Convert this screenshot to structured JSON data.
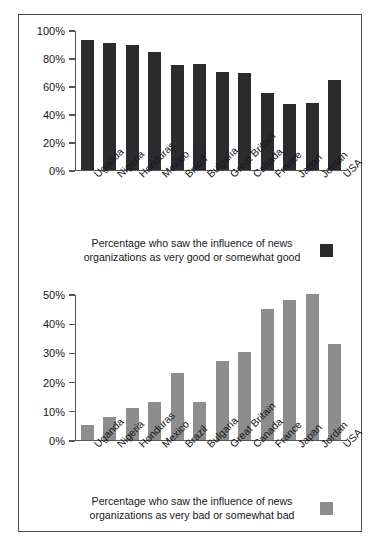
{
  "chart_data": [
    {
      "type": "bar",
      "id": "good",
      "title": "",
      "xlabel": "",
      "ylabel": "",
      "ylim": [
        0,
        100
      ],
      "yticks": [
        0,
        20,
        40,
        60,
        80,
        100
      ],
      "ytick_labels": [
        "0%",
        "20%",
        "40%",
        "60%",
        "80%",
        "100%"
      ],
      "grid": false,
      "bar_color": "#2b2b2e",
      "legend_position": "bottom",
      "legend": "Percentage who saw the influence of news organizations as very good or somewhat good",
      "legend_line1": "Percentage who saw the influence of news",
      "legend_line2": "organizations as very good or somewhat good",
      "categories": [
        "Uganda",
        "Nigeria",
        "Honduras",
        "Mexico",
        "Brazil",
        "Bulgaria",
        "Great Britain",
        "Canada",
        "France",
        "Japan",
        "Jordan",
        "USA"
      ],
      "values": [
        93,
        91,
        89,
        84,
        75,
        76,
        70,
        69,
        55,
        47,
        48,
        64
      ]
    },
    {
      "type": "bar",
      "id": "bad",
      "title": "",
      "xlabel": "",
      "ylabel": "",
      "ylim": [
        0,
        50
      ],
      "yticks": [
        0,
        10,
        20,
        30,
        40,
        50
      ],
      "ytick_labels": [
        "0%",
        "10%",
        "20%",
        "30%",
        "40%",
        "50%"
      ],
      "grid": false,
      "bar_color": "#8d8d8d",
      "legend_position": "bottom",
      "legend": "Percentage who saw the influence of news organizations as very bad or somewhat bad",
      "legend_line1": "Percentage who saw the influence of news",
      "legend_line2": "organizations as very bad or somewhat bad",
      "categories": [
        "Uganda",
        "Nigeria",
        "Honduras",
        "Mexico",
        "Brazil",
        "Bulgaria",
        "Great Britain",
        "Canada",
        "France",
        "Japan",
        "Jordan",
        "USA"
      ],
      "values": [
        5,
        8,
        11,
        13,
        23,
        13,
        27,
        30,
        45,
        48,
        50,
        33
      ]
    }
  ]
}
